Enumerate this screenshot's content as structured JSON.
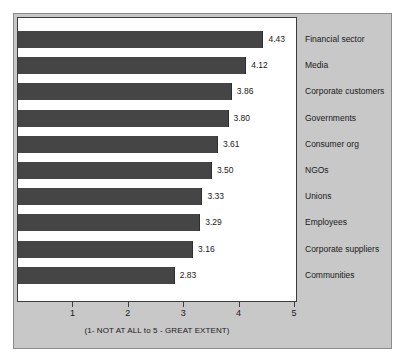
{
  "chart_data": {
    "type": "bar",
    "orientation": "horizontal",
    "title": "",
    "xlabel": "(1- NOT AT ALL to 5 - GREAT EXTENT)",
    "ylabel": "",
    "xlim": [
      0,
      5
    ],
    "grid": false,
    "legend": null,
    "xticks": [
      "1",
      "2",
      "3",
      "4",
      "5"
    ],
    "xtick_values": [
      1,
      2,
      3,
      4,
      5
    ],
    "categories": [
      "Financial sector",
      "Media",
      "Corporate customers",
      "Governments",
      "Consumer org",
      "NGOs",
      "Unions",
      "Employees",
      "Corporate suppliers",
      "Communities"
    ],
    "values": [
      4.43,
      4.12,
      3.86,
      3.8,
      3.61,
      3.5,
      3.33,
      3.29,
      3.16,
      2.83
    ],
    "data_labels": [
      "4.43",
      "4.12",
      "3.86",
      "3.80",
      "3.61",
      "3.50",
      "3.33",
      "3.29",
      "3.16",
      "2.83"
    ],
    "colors": {
      "bar": "#454545",
      "panel_background": "#c8c8c8",
      "plot_background": "#ffffff",
      "axis": "#3c3c3c",
      "text": "#1a1a1a"
    }
  }
}
